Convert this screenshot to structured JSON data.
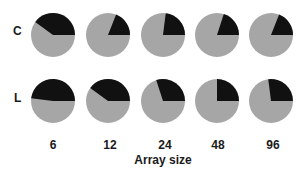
{
  "chart_data": {
    "type": "pie",
    "title": "",
    "xlabel": "Array size",
    "ylabel": "",
    "categories": [
      "6",
      "12",
      "24",
      "48",
      "96"
    ],
    "rows": [
      "C",
      "L"
    ],
    "slice_colors": {
      "black": "#111111",
      "gray": "#a6a6a6"
    },
    "series": [
      {
        "name": "C",
        "black_fraction": [
          0.4,
          0.19,
          0.23,
          0.2,
          0.19
        ]
      },
      {
        "name": "L",
        "black_fraction": [
          0.48,
          0.4,
          0.3,
          0.25,
          0.27
        ]
      }
    ],
    "grid": false,
    "legend": "none"
  },
  "labels": {
    "row_c": "C",
    "row_l": "L",
    "x_title": "Array size",
    "x_ticks": [
      "6",
      "12",
      "24",
      "48",
      "96"
    ]
  }
}
